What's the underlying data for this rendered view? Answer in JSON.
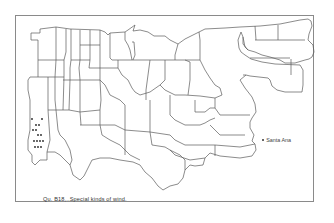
{
  "map": {
    "caption": "Qu. B18,..Special kinds of wind.",
    "legend_place": "Santa Ana",
    "line_color": "#5a5a5a",
    "dot_color": "#222222",
    "frame_color": "#8a8a8a",
    "response_dots": [
      {
        "x": 32,
        "y": 119
      },
      {
        "x": 42,
        "y": 119
      },
      {
        "x": 36,
        "y": 125
      },
      {
        "x": 39,
        "y": 125
      },
      {
        "x": 33,
        "y": 130
      },
      {
        "x": 36,
        "y": 130
      },
      {
        "x": 38,
        "y": 135
      },
      {
        "x": 41,
        "y": 135
      },
      {
        "x": 34,
        "y": 141
      },
      {
        "x": 37,
        "y": 141
      },
      {
        "x": 40,
        "y": 141
      },
      {
        "x": 43,
        "y": 141
      },
      {
        "x": 35,
        "y": 147
      },
      {
        "x": 38,
        "y": 147
      },
      {
        "x": 41,
        "y": 147
      }
    ]
  }
}
